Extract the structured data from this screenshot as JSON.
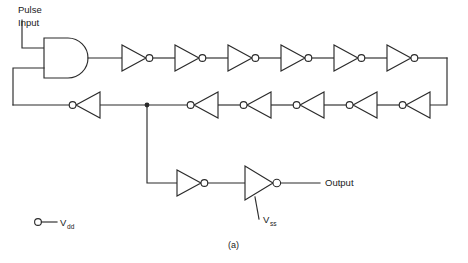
{
  "figure": {
    "caption": "(a)"
  },
  "labels": {
    "pulse_input_line1": "Pulse",
    "pulse_input_line2": "Input",
    "output": "Output",
    "vdd_symbol": "V",
    "vdd_subscript": "dd",
    "vss_symbol": "V",
    "vss_subscript": "ss"
  },
  "colors": {
    "wire": "#2b2b2b",
    "background": "#ffffff",
    "text": "#1a1a1a"
  },
  "components": {
    "and_gate": {
      "name": "AND gate",
      "inputs": 2
    },
    "top_inverter_chain": {
      "name": "top inverter chain",
      "count": 6,
      "direction": "right"
    },
    "middle_inverter_chain": {
      "name": "middle inverter chain",
      "count": 5,
      "direction": "left"
    },
    "bottom_inverter_chain": {
      "name": "output inverter chain",
      "count": 2,
      "direction": "right"
    },
    "junction_count": 1,
    "supply_terminals": 2
  }
}
